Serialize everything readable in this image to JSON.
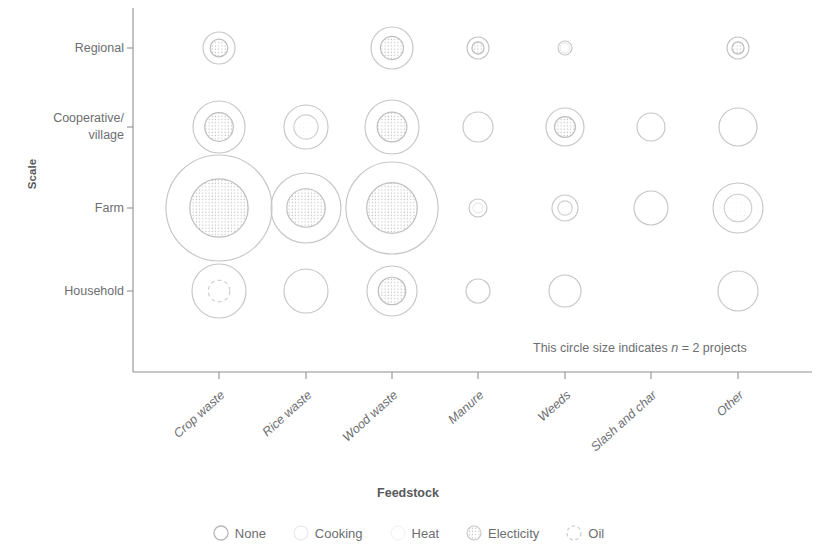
{
  "axes": {
    "y_title": "Scale",
    "x_title": "Feedstock",
    "y_categories": [
      "Regional",
      "Cooperative/\nvillage",
      "Farm",
      "Household"
    ],
    "x_categories": [
      "Crop waste",
      "Rice waste",
      "Wood waste",
      "Manure",
      "Weeds",
      "Slash and char",
      "Other"
    ]
  },
  "annotation": {
    "prefix": "This circle size indicates ",
    "symbol": "n",
    "suffix": " = 2 projects"
  },
  "legend": {
    "items": [
      {
        "label": "None",
        "marker": "circle-outline-icon",
        "color": "#b0b0b0"
      },
      {
        "label": "Cooking",
        "marker": "circle-faint-icon",
        "color": "#d9d9d9"
      },
      {
        "label": "Heat",
        "marker": "circle-very-faint-icon",
        "color": "#e8e8e8"
      },
      {
        "label": "Electicity",
        "marker": "circle-dotted-fill-icon",
        "color": "#c8c8c8"
      },
      {
        "label": "Oil",
        "marker": "circle-dashed-icon",
        "color": "#d0d0d0"
      }
    ]
  },
  "chart_data": {
    "type": "scatter",
    "title": "",
    "xlabel": "Feedstock",
    "ylabel": "Scale",
    "legend_position": "bottom",
    "grid": false,
    "size_legend": "This circle size indicates n = 2 projects",
    "size_legend_n": 2,
    "categories": [
      "Crop waste",
      "Rice waste",
      "Wood waste",
      "Manure",
      "Weeds",
      "Slash and char",
      "Other"
    ],
    "y_categories": [
      "Regional",
      "Cooperative/village",
      "Farm",
      "Household"
    ],
    "points": [
      {
        "x": "Crop waste",
        "y": "Regional",
        "n": 5,
        "r": 16,
        "fill": "electricity"
      },
      {
        "x": "Rice waste",
        "y": "Regional",
        "n": 0,
        "r": 0,
        "fill": "none"
      },
      {
        "x": "Wood waste",
        "y": "Regional",
        "n": 8,
        "r": 21,
        "fill": "electricity"
      },
      {
        "x": "Manure",
        "y": "Regional",
        "n": 2,
        "r": 11,
        "fill": "electricity"
      },
      {
        "x": "Weeds",
        "y": "Regional",
        "n": 1,
        "r": 7,
        "fill": "heat"
      },
      {
        "x": "Slash and char",
        "y": "Regional",
        "n": 0,
        "r": 0,
        "fill": "none"
      },
      {
        "x": "Other",
        "y": "Regional",
        "n": 2,
        "r": 11,
        "fill": "electricity"
      },
      {
        "x": "Crop waste",
        "y": "Cooperative/village",
        "n": 12,
        "r": 26,
        "fill": "electricity"
      },
      {
        "x": "Rice waste",
        "y": "Cooperative/village",
        "n": 7,
        "r": 22,
        "fill": "cooking"
      },
      {
        "x": "Wood waste",
        "y": "Cooperative/village",
        "n": 13,
        "r": 27,
        "fill": "electricity"
      },
      {
        "x": "Manure",
        "y": "Cooperative/village",
        "n": 3,
        "r": 15,
        "fill": "none"
      },
      {
        "x": "Weeds",
        "y": "Cooperative/village",
        "n": 6,
        "r": 19,
        "fill": "electricity"
      },
      {
        "x": "Slash and char",
        "y": "Cooperative/village",
        "n": 3,
        "r": 14,
        "fill": "none"
      },
      {
        "x": "Other",
        "y": "Cooperative/village",
        "n": 5,
        "r": 19,
        "fill": "none"
      },
      {
        "x": "Crop waste",
        "y": "Farm",
        "n": 30,
        "r": 53,
        "fill": "electricity"
      },
      {
        "x": "Rice waste",
        "y": "Farm",
        "n": 16,
        "r": 35,
        "fill": "electricity"
      },
      {
        "x": "Wood waste",
        "y": "Farm",
        "n": 25,
        "r": 46,
        "fill": "electricity"
      },
      {
        "x": "Manure",
        "y": "Farm",
        "n": 1,
        "r": 9,
        "fill": "heat"
      },
      {
        "x": "Weeds",
        "y": "Farm",
        "n": 2,
        "r": 13,
        "fill": "cooking"
      },
      {
        "x": "Slash and char",
        "y": "Farm",
        "n": 4,
        "r": 17,
        "fill": "none"
      },
      {
        "x": "Other",
        "y": "Farm",
        "n": 9,
        "r": 25,
        "fill": "cooking"
      },
      {
        "x": "Crop waste",
        "y": "Household",
        "n": 9,
        "r": 27,
        "fill": "oil"
      },
      {
        "x": "Rice waste",
        "y": "Household",
        "n": 6,
        "r": 22,
        "fill": "none"
      },
      {
        "x": "Wood waste",
        "y": "Household",
        "n": 8,
        "r": 25,
        "fill": "electricity"
      },
      {
        "x": "Manure",
        "y": "Household",
        "n": 2,
        "r": 12,
        "fill": "none"
      },
      {
        "x": "Weeds",
        "y": "Household",
        "n": 3,
        "r": 16,
        "fill": "none"
      },
      {
        "x": "Slash and char",
        "y": "Household",
        "n": 0,
        "r": 0,
        "fill": "none"
      },
      {
        "x": "Other",
        "y": "Household",
        "n": 4,
        "r": 20,
        "fill": "none"
      }
    ]
  }
}
